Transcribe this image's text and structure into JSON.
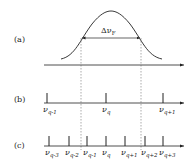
{
  "panels": {
    "a": {
      "label": "(a)",
      "bandwidth_label": "Δν",
      "bandwidth_sub": "F"
    },
    "b": {
      "label": "(b)",
      "modes": [
        {
          "sym": "ν",
          "sub": "q-1",
          "x": 47
        },
        {
          "sym": "ν",
          "sub": "q",
          "x": 106
        },
        {
          "sym": "ν",
          "sub": "q+1",
          "x": 163
        }
      ]
    },
    "c": {
      "label": "(c)",
      "modes": [
        {
          "sym": "ν",
          "sub": "q-3",
          "x": 49
        },
        {
          "sym": "ν",
          "sub": "q-2",
          "x": 69
        },
        {
          "sym": "ν",
          "sub": "q-1",
          "x": 87
        },
        {
          "sym": "ν",
          "sub": "q",
          "x": 106
        },
        {
          "sym": "ν",
          "sub": "q+1",
          "x": 125
        },
        {
          "sym": "ν",
          "sub": "q+2",
          "x": 145
        },
        {
          "sym": "ν",
          "sub": "q+3",
          "x": 163
        }
      ]
    }
  },
  "colors": {
    "ink": "#222222",
    "background": "#ffffff"
  }
}
